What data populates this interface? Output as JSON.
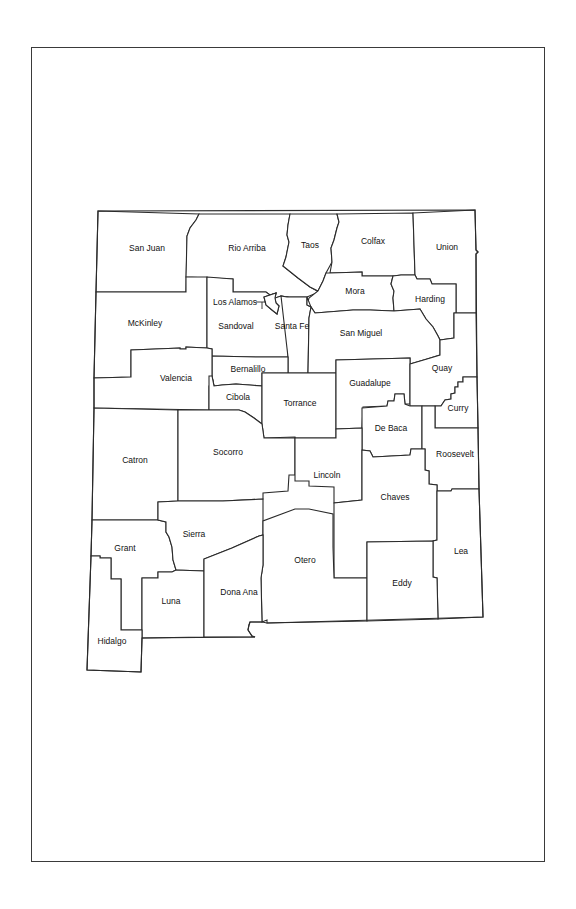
{
  "map": {
    "title": "New Mexico Counties",
    "counties": [
      {
        "name": "San Juan",
        "x": 147,
        "y": 249
      },
      {
        "name": "Rio Arriba",
        "x": 247,
        "y": 249
      },
      {
        "name": "Taos",
        "x": 310,
        "y": 246
      },
      {
        "name": "Colfax",
        "x": 373,
        "y": 242
      },
      {
        "name": "Union",
        "x": 447,
        "y": 248
      },
      {
        "name": "Mora",
        "x": 355,
        "y": 292
      },
      {
        "name": "Harding",
        "x": 430,
        "y": 300
      },
      {
        "name": "Los Alamos",
        "x": 235,
        "y": 303
      },
      {
        "name": "McKinley",
        "x": 145,
        "y": 324
      },
      {
        "name": "Sandoval",
        "x": 236,
        "y": 327
      },
      {
        "name": "Santa Fe",
        "x": 292,
        "y": 327
      },
      {
        "name": "San Miguel",
        "x": 361,
        "y": 334
      },
      {
        "name": "Bernalillo",
        "x": 248,
        "y": 370
      },
      {
        "name": "Valencia",
        "x": 176,
        "y": 379
      },
      {
        "name": "Quay",
        "x": 442,
        "y": 369
      },
      {
        "name": "Guadalupe",
        "x": 370,
        "y": 384
      },
      {
        "name": "Cibola",
        "x": 238,
        "y": 398
      },
      {
        "name": "Torrance",
        "x": 300,
        "y": 404
      },
      {
        "name": "Curry",
        "x": 458,
        "y": 409
      },
      {
        "name": "De Baca",
        "x": 391,
        "y": 429
      },
      {
        "name": "Catron",
        "x": 135,
        "y": 461
      },
      {
        "name": "Socorro",
        "x": 228,
        "y": 453
      },
      {
        "name": "Roosevelt",
        "x": 455,
        "y": 455
      },
      {
        "name": "Lincoln",
        "x": 327,
        "y": 476
      },
      {
        "name": "Chaves",
        "x": 395,
        "y": 498
      },
      {
        "name": "Grant",
        "x": 125,
        "y": 549
      },
      {
        "name": "Sierra",
        "x": 194,
        "y": 535
      },
      {
        "name": "Lea",
        "x": 461,
        "y": 552
      },
      {
        "name": "Otero",
        "x": 305,
        "y": 561
      },
      {
        "name": "Eddy",
        "x": 402,
        "y": 584
      },
      {
        "name": "Luna",
        "x": 171,
        "y": 602
      },
      {
        "name": "Dona Ana",
        "x": 239,
        "y": 593
      },
      {
        "name": "Hidalgo",
        "x": 112,
        "y": 642
      }
    ]
  },
  "colors": {
    "stroke": "#2a2a2a",
    "background": "#ffffff",
    "text": "#111111"
  }
}
